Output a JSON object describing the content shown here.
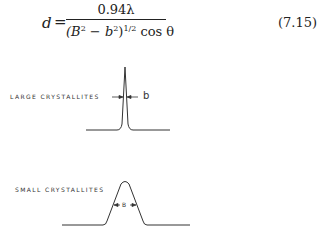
{
  "equation": {
    "lhs": "d",
    "equals": "=",
    "numerator": "0.94λ",
    "denominator_base": "(B",
    "denominator_sup1": "2",
    "denominator_mid": " − b",
    "denominator_sup2": "2",
    "denominator_close": ")",
    "denominator_exp": "1/2",
    "denominator_tail": " cos θ",
    "number": "(7.15)"
  },
  "figure": {
    "large": {
      "label": "LARGE CRYSTALLITES",
      "width_symbol": "b"
    },
    "small": {
      "label": "SMALL CRYSTALLITES",
      "width_symbol": "B"
    }
  }
}
